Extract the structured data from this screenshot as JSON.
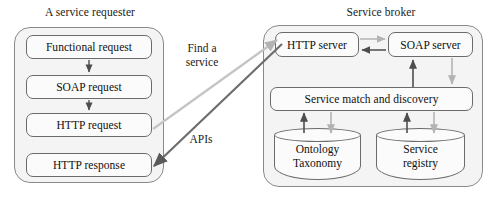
{
  "diagram": {
    "type": "block-diagram",
    "colors": {
      "dark_arrow": "#4d4d4d",
      "light_arrow": "#b3b3b3",
      "container_fill": "#f4f4f4",
      "container_stroke": "#8a8a8a",
      "box_fill": "#fbfbfb",
      "box_stroke": "#6b6b6b",
      "text": "#101010"
    }
  },
  "requester": {
    "title": "A service requester",
    "boxes": [
      {
        "label": "Functional request"
      },
      {
        "label": "SOAP request"
      },
      {
        "label": "HTTP request"
      },
      {
        "label": "HTTP response"
      }
    ]
  },
  "broker": {
    "title": "Service broker",
    "boxes": [
      {
        "label": "HTTP server"
      },
      {
        "label": "SOAP server"
      },
      {
        "label": "Service match and discovery"
      }
    ],
    "stores": [
      {
        "line1": "Ontology",
        "line2": "Taxonomy"
      },
      {
        "line1": "Service",
        "line2": "registry"
      }
    ]
  },
  "connectors": {
    "find_a_service": {
      "line1": "Find a",
      "line2": "service"
    },
    "apis": {
      "label": "APIs"
    }
  }
}
